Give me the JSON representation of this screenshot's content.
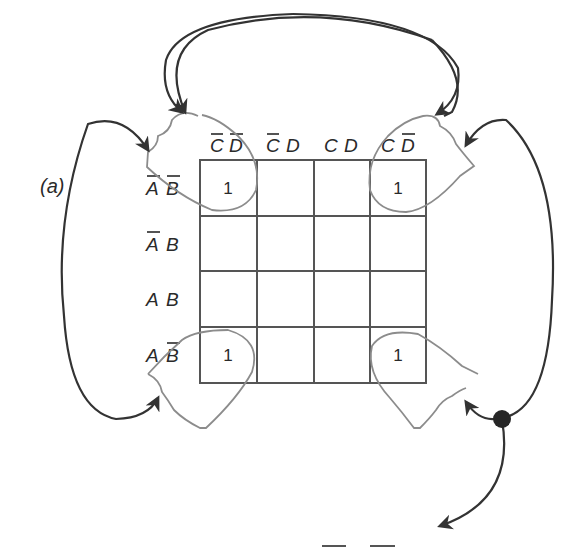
{
  "figure_label": "(a)",
  "kmap": {
    "column_headers": [
      {
        "vars": [
          "C",
          "D"
        ],
        "negated": [
          true,
          true
        ],
        "text": "C̄ D̄"
      },
      {
        "vars": [
          "C",
          "D"
        ],
        "negated": [
          true,
          false
        ],
        "text": "C̄ D"
      },
      {
        "vars": [
          "C",
          "D"
        ],
        "negated": [
          false,
          false
        ],
        "text": "C D"
      },
      {
        "vars": [
          "C",
          "D"
        ],
        "negated": [
          false,
          true
        ],
        "text": "C D̄"
      }
    ],
    "row_headers": [
      {
        "vars": [
          "A",
          "B"
        ],
        "negated": [
          true,
          true
        ],
        "text": "Ā B̄"
      },
      {
        "vars": [
          "A",
          "B"
        ],
        "negated": [
          true,
          false
        ],
        "text": "Ā B"
      },
      {
        "vars": [
          "A",
          "B"
        ],
        "negated": [
          false,
          false
        ],
        "text": "A B"
      },
      {
        "vars": [
          "A",
          "B"
        ],
        "negated": [
          false,
          true
        ],
        "text": "A B̄"
      }
    ],
    "cells": [
      [
        "1",
        "",
        "",
        "1"
      ],
      [
        "",
        "",
        "",
        ""
      ],
      [
        "",
        "",
        "",
        ""
      ],
      [
        "1",
        "",
        "",
        "1"
      ]
    ],
    "groups": [
      {
        "name": "four-corners",
        "cells": [
          [
            0,
            0
          ],
          [
            0,
            3
          ],
          [
            3,
            0
          ],
          [
            3,
            3
          ]
        ],
        "note": "corner loops joined by wrap-around arrows"
      }
    ]
  },
  "result_partial": "B̄ D̄",
  "colors": {
    "grid": "#555555",
    "loops": "#8c8c8c",
    "arrows": "#333333",
    "text": "#2a2a2a"
  }
}
